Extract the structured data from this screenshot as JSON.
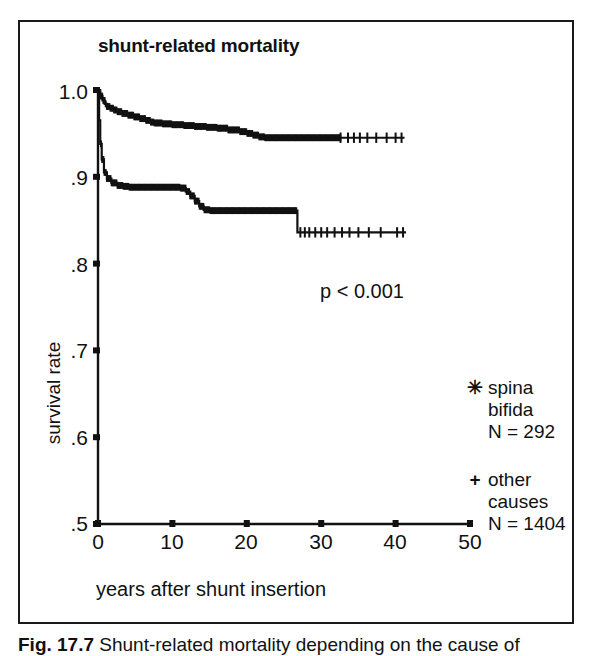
{
  "figure": {
    "title": "shunt-related mortality",
    "caption_label": "Fig. 17.7",
    "caption_text": "Shunt-related mortality depending on the cause of"
  },
  "annotations": {
    "p_value": "p < 0.001"
  },
  "legend": {
    "position": "right",
    "entries": [
      {
        "marker": "✳",
        "marker_name": "asterisk-censor-marker",
        "line1": "spina",
        "line2": "bifida",
        "line3": "N = 292"
      },
      {
        "marker": "+",
        "marker_name": "plus-censor-marker",
        "line1": "other",
        "line2": "causes",
        "line3": "N = 1404"
      }
    ]
  },
  "axes": {
    "x_title": "years after shunt insertion",
    "y_title": "survival rate",
    "x_ticks": [
      "0",
      "10",
      "20",
      "30",
      "40",
      "50"
    ],
    "y_ticks": [
      "1.0",
      ".9",
      ".8",
      ".7",
      ".6",
      ".5"
    ]
  },
  "chart_data": {
    "type": "line",
    "subtype": "kaplan-meier-survival",
    "title": "shunt-related mortality",
    "xlabel": "years after shunt insertion",
    "ylabel": "survival rate",
    "xlim": [
      0,
      50
    ],
    "ylim": [
      0.5,
      1.0
    ],
    "xticks": [
      0,
      10,
      20,
      30,
      40,
      50
    ],
    "yticks": [
      0.5,
      0.6,
      0.7,
      0.8,
      0.9,
      1.0
    ],
    "grid": false,
    "legend_position": "right",
    "annotations": [
      {
        "text": "p < 0.001",
        "x": 27.5,
        "y": 0.787
      }
    ],
    "series": [
      {
        "name": "other causes",
        "n": 1404,
        "censor_marker": "+",
        "x": [
          0.0,
          0.3,
          0.6,
          0.9,
          1.2,
          1.6,
          2.0,
          2.6,
          3.2,
          4.0,
          4.8,
          5.6,
          6.4,
          7.0,
          7.6,
          8.6,
          10.0,
          11.5,
          13.0,
          14.5,
          16.0,
          17.5,
          19.0,
          20.0,
          20.8,
          21.6,
          22.4,
          24.0,
          27.0,
          30.0,
          33.0,
          36.0,
          38.5,
          41.0
        ],
        "y": [
          1.0,
          0.993,
          0.988,
          0.984,
          0.981,
          0.979,
          0.977,
          0.975,
          0.973,
          0.971,
          0.969,
          0.967,
          0.965,
          0.963,
          0.962,
          0.961,
          0.96,
          0.959,
          0.958,
          0.957,
          0.956,
          0.954,
          0.952,
          0.95,
          0.948,
          0.946,
          0.945,
          0.945,
          0.945,
          0.945,
          0.945,
          0.945,
          0.945,
          0.945
        ],
        "censor_x": [
          32.6,
          33.6,
          34.4,
          35.2,
          36.2,
          37.4,
          38.8,
          40.0,
          40.8
        ],
        "end_x": 41.2,
        "final_value": 0.945
      },
      {
        "name": "spina bifida",
        "n": 292,
        "censor_marker": "✳",
        "x": [
          0.0,
          0.15,
          0.3,
          0.5,
          0.8,
          1.2,
          1.8,
          2.6,
          3.4,
          4.2,
          5.0,
          6.0,
          7.0,
          8.5,
          10.0,
          11.0,
          11.8,
          12.4,
          13.0,
          13.6,
          14.2,
          15.0,
          17.0,
          19.0,
          21.0,
          23.0,
          25.0,
          26.6,
          26.8,
          28.0,
          31.0,
          34.0,
          37.0,
          40.0,
          41.2
        ],
        "y": [
          1.0,
          0.965,
          0.938,
          0.92,
          0.905,
          0.898,
          0.893,
          0.89,
          0.889,
          0.888,
          0.888,
          0.888,
          0.888,
          0.888,
          0.888,
          0.887,
          0.883,
          0.878,
          0.872,
          0.866,
          0.862,
          0.861,
          0.861,
          0.861,
          0.861,
          0.861,
          0.861,
          0.861,
          0.836,
          0.836,
          0.836,
          0.836,
          0.836,
          0.836,
          0.836
        ],
        "censor_x": [
          27.2,
          27.8,
          28.4,
          29.2,
          30.0,
          30.8,
          31.8,
          32.8,
          33.8,
          35.0,
          36.4,
          38.0,
          40.2,
          41.0
        ],
        "end_x": 41.4,
        "final_value": 0.836
      }
    ]
  },
  "colors": {
    "line": "#111111",
    "frame": "#1a1a1a",
    "background": "#ffffff"
  }
}
